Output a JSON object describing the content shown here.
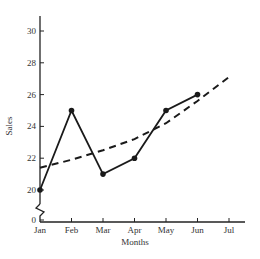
{
  "chart_data": {
    "type": "line",
    "title": "",
    "xlabel": "Months",
    "ylabel": "Sales",
    "categories": [
      "Jan",
      "Feb",
      "Mar",
      "Apr",
      "May",
      "Jun",
      "Jul"
    ],
    "series": [
      {
        "name": "Sales",
        "style": "solid",
        "markers": true,
        "values": [
          20,
          25,
          21,
          22,
          25,
          26,
          null
        ]
      },
      {
        "name": "Trend",
        "style": "dashed",
        "markers": false,
        "values": [
          21.4,
          21.9,
          22.5,
          23.2,
          24.2,
          25.6,
          27.1
        ]
      }
    ],
    "yticks": [
      0,
      20,
      22,
      24,
      26,
      28,
      30
    ],
    "ylim": [
      20,
      31
    ],
    "axis_break": true,
    "grid": false,
    "legend": "none"
  },
  "labels": {
    "xlabel": "Months",
    "ylabel": "Sales",
    "months": [
      "Jan",
      "Feb",
      "Mar",
      "Apr",
      "May",
      "Jun",
      "Jul"
    ],
    "yticks": [
      "0",
      "20",
      "22",
      "24",
      "26",
      "28",
      "30"
    ]
  },
  "colors": {
    "line": "#1a1a1a",
    "text": "#333333"
  }
}
